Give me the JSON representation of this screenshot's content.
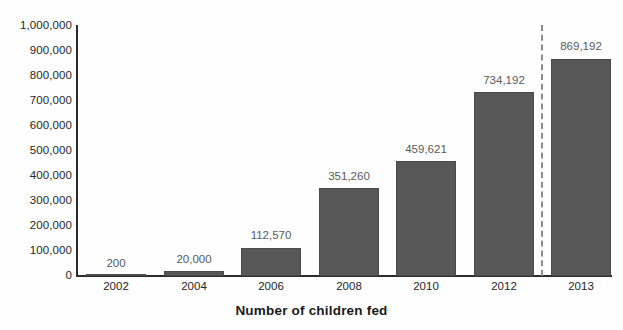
{
  "chart_data": {
    "type": "bar",
    "title": "Number of children fed",
    "xlabel": "",
    "ylabel": "",
    "categories": [
      "2002",
      "2004",
      "2006",
      "2008",
      "2010",
      "2012",
      "2013"
    ],
    "values": [
      200,
      20000,
      112570,
      351260,
      459621,
      734192,
      869192
    ],
    "value_labels": [
      "200",
      "20,000",
      "112,570",
      "351,260",
      "459,621",
      "734,192",
      "869,192"
    ],
    "ylim": [
      0,
      1000000
    ],
    "ytick_values": [
      0,
      100000,
      200000,
      300000,
      400000,
      500000,
      600000,
      700000,
      800000,
      900000,
      1000000
    ],
    "ytick_labels": [
      "0",
      "100,000",
      "200,000",
      "300,000",
      "400,000",
      "500,000",
      "600,000",
      "700,000",
      "800,000",
      "900,000",
      "1,000,000"
    ],
    "grid": false,
    "legend": null,
    "legend_position": "none",
    "series": [
      {
        "name": "Number of children fed",
        "values": [
          200,
          20000,
          112570,
          351260,
          459621,
          734192,
          869192
        ],
        "color": "#575757"
      }
    ],
    "annotations": [
      {
        "type": "vertical-dashed-line",
        "between": [
          "2012",
          "2013"
        ],
        "color": "#8c8c8c"
      }
    ]
  },
  "colors": {
    "bar_fill": "#575757",
    "bar_stroke": "#4a4a4a",
    "axis": "#2b2b2b",
    "tick_text": "#262626",
    "value_label_text": "#5a5a5a",
    "divider": "#8c8c8c",
    "background": "#fefefe"
  }
}
